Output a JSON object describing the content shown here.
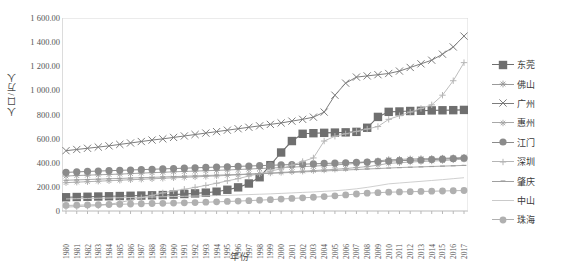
{
  "chart_data": {
    "type": "line",
    "title": "",
    "xlabel": "年份",
    "ylabel": "人口/万人",
    "ylim": [
      0,
      1600
    ],
    "ytick_labels": [
      "1 600.00",
      "1 400.00",
      "1 200.00",
      "1 000.00",
      "800.00",
      "600.00",
      "400.00",
      "200.00",
      "0"
    ],
    "ytick_values": [
      1600,
      1400,
      1200,
      1000,
      800,
      600,
      400,
      200,
      0
    ],
    "grid": false,
    "legend_position": "right",
    "x": [
      1980,
      1981,
      1982,
      1983,
      1984,
      1985,
      1986,
      1987,
      1988,
      1989,
      1990,
      1991,
      1992,
      1993,
      1994,
      1995,
      1996,
      1997,
      1998,
      1999,
      2000,
      2001,
      2002,
      2003,
      2004,
      2005,
      2006,
      2007,
      2008,
      2009,
      2010,
      2011,
      2012,
      2013,
      2014,
      2015,
      2016,
      2017
    ],
    "categories": [
      "1980",
      "1981",
      "1982",
      "1983",
      "1984",
      "1985",
      "1986",
      "1987",
      "1988",
      "1989",
      "1990",
      "1991",
      "1992",
      "1993",
      "1994",
      "1995",
      "1996",
      "1997",
      "1998",
      "1999",
      "2000",
      "2001",
      "2002",
      "2003",
      "2004",
      "2005",
      "2006",
      "2007",
      "2008",
      "2009",
      "2010",
      "2011",
      "2012",
      "2013",
      "2014",
      "2015",
      "2016",
      "2017"
    ],
    "series": [
      {
        "name": "东莞",
        "color": "#6f6f6f",
        "marker": "square",
        "marker_size": 4.2,
        "line_width": 1.1,
        "values": [
          114,
          116,
          118,
          120,
          122,
          124,
          126,
          128,
          130,
          132,
          136,
          141,
          146,
          152,
          160,
          176,
          196,
          228,
          280,
          380,
          485,
          580,
          640,
          645,
          648,
          650,
          652,
          656,
          690,
          780,
          822,
          825,
          829,
          831,
          834,
          835,
          836,
          838
        ]
      },
      {
        "name": "佛山",
        "color": "#9a9a9a",
        "marker": "star",
        "marker_size": 3.4,
        "line_width": 0.9,
        "values": [
          290,
          294,
          297,
          300,
          303,
          306,
          310,
          314,
          318,
          321,
          325,
          328,
          331,
          334,
          337,
          340,
          344,
          348,
          352,
          356,
          360,
          364,
          368,
          372,
          377,
          382,
          388,
          395,
          405,
          415,
          425,
          428,
          431,
          433,
          435,
          437,
          440,
          444
        ]
      },
      {
        "name": "广州",
        "color": "#7d7d7d",
        "marker": "cross",
        "marker_size": 3.6,
        "line_width": 1.0,
        "values": [
          500,
          510,
          520,
          530,
          540,
          552,
          564,
          576,
          588,
          598,
          610,
          622,
          634,
          646,
          658,
          670,
          682,
          694,
          706,
          718,
          730,
          745,
          760,
          778,
          820,
          960,
          1060,
          1110,
          1120,
          1130,
          1140,
          1160,
          1190,
          1220,
          1250,
          1300,
          1360,
          1450
        ]
      },
      {
        "name": "惠州",
        "color": "#a8a8a8",
        "marker": "star",
        "marker_size": 3.2,
        "line_width": 0.9,
        "values": [
          235,
          239,
          243,
          247,
          251,
          255,
          259,
          263,
          267,
          271,
          275,
          279,
          283,
          287,
          291,
          295,
          300,
          305,
          310,
          315,
          320,
          325,
          330,
          335,
          340,
          346,
          352,
          360,
          368,
          380,
          395,
          400,
          406,
          410,
          414,
          418,
          424,
          430
        ]
      },
      {
        "name": "江门",
        "color": "#8b8b8b",
        "marker": "circle",
        "marker_size": 3.6,
        "line_width": 1.0,
        "values": [
          320,
          324,
          328,
          331,
          334,
          337,
          340,
          343,
          346,
          349,
          352,
          355,
          358,
          361,
          364,
          367,
          370,
          373,
          376,
          379,
          382,
          385,
          388,
          391,
          394,
          397,
          400,
          403,
          406,
          410,
          414,
          417,
          420,
          423,
          426,
          430,
          434,
          438
        ]
      },
      {
        "name": "深圳",
        "color": "#b5b5b5",
        "marker": "plus",
        "marker_size": 3.2,
        "line_width": 0.9,
        "values": [
          33,
          36,
          40,
          45,
          55,
          70,
          90,
          110,
          130,
          150,
          167,
          180,
          196,
          212,
          230,
          250,
          268,
          290,
          310,
          330,
          350,
          380,
          410,
          440,
          580,
          620,
          640,
          660,
          680,
          700,
          760,
          790,
          820,
          850,
          880,
          960,
          1080,
          1230
        ]
      },
      {
        "name": "肇庆",
        "color": "#9f9f9f",
        "marker": "dash",
        "marker_size": 2.4,
        "line_width": 0.9,
        "values": [
          255,
          258,
          261,
          264,
          267,
          270,
          273,
          276,
          279,
          282,
          285,
          288,
          291,
          294,
          297,
          300,
          303,
          306,
          309,
          312,
          316,
          320,
          324,
          328,
          332,
          336,
          340,
          344,
          348,
          352,
          356,
          360,
          363,
          366,
          369,
          372,
          375,
          378
        ]
      },
      {
        "name": "中山",
        "color": "#cacaca",
        "marker": "none",
        "marker_size": 0,
        "line_width": 0.9,
        "values": [
          100,
          102,
          104,
          106,
          108,
          110,
          112,
          114,
          116,
          118,
          120,
          122,
          124,
          126,
          128,
          130,
          133,
          136,
          139,
          142,
          146,
          150,
          154,
          158,
          163,
          168,
          175,
          184,
          196,
          210,
          225,
          232,
          239,
          246,
          253,
          260,
          268,
          276
        ]
      },
      {
        "name": "珠海",
        "color": "#b0b0b0",
        "marker": "circle",
        "marker_size": 3.4,
        "line_width": 0.9,
        "values": [
          46,
          48,
          50,
          52,
          54,
          56,
          58,
          60,
          62,
          64,
          66,
          68,
          70,
          73,
          76,
          79,
          82,
          86,
          90,
          94,
          99,
          104,
          109,
          114,
          120,
          126,
          133,
          141,
          148,
          152,
          156,
          158,
          160,
          162,
          164,
          166,
          168,
          170
        ]
      }
    ]
  },
  "legend": {
    "items": [
      {
        "label": "东莞"
      },
      {
        "label": "佛山"
      },
      {
        "label": "广州"
      },
      {
        "label": "惠州"
      },
      {
        "label": "江门"
      },
      {
        "label": "深圳"
      },
      {
        "label": "肇庆"
      },
      {
        "label": "中山"
      },
      {
        "label": "珠海"
      }
    ]
  },
  "axis": {
    "y_title": "人口/万人",
    "x_title": "年份"
  }
}
